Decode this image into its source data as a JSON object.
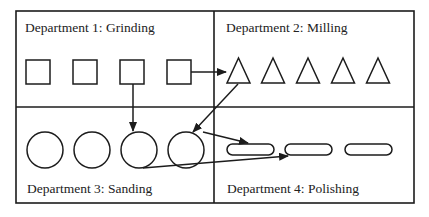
{
  "diagram": {
    "type": "process-layout",
    "frame": {
      "x": 16,
      "y": 11,
      "width": 398,
      "height": 192,
      "divider_x": 214,
      "divider_y": 107
    },
    "departments": [
      {
        "id": 1,
        "label": "Department 1: Grinding",
        "label_pos": [
          25,
          32
        ],
        "shape": "square",
        "count": 4
      },
      {
        "id": 2,
        "label": "Department 2: Milling",
        "label_pos": [
          226,
          32
        ],
        "shape": "triangle",
        "count": 5
      },
      {
        "id": 3,
        "label": "Department 3: Sanding",
        "label_pos": [
          27,
          193
        ],
        "shape": "circle",
        "count": 4
      },
      {
        "id": 4,
        "label": "Department 4: Polishing",
        "label_pos": [
          227,
          193
        ],
        "shape": "rounded-bar",
        "count": 3
      }
    ],
    "flows": [
      {
        "from": "Grinding machine 4",
        "to": "Milling machine 1"
      },
      {
        "from": "Grinding machine 3",
        "to": "Sanding machine 3"
      },
      {
        "from": "Milling machine 1",
        "to": "Sanding machine 4"
      },
      {
        "from": "Sanding machine 4",
        "to": "Polishing machine 1"
      },
      {
        "from": "Sanding machine 3",
        "to": "Polishing machine 2"
      }
    ],
    "colors": {
      "line": "#1c1c1c",
      "background": "#ffffff"
    }
  }
}
